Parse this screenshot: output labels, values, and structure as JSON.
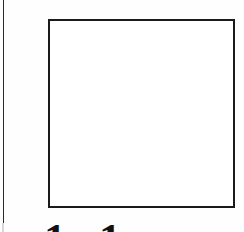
{
  "page": {
    "name": "scanned-page-fragment",
    "width": 244,
    "height": 232,
    "background_color": "#fefefe",
    "ink_color": "#1a1a1a"
  },
  "margin_rule": {
    "name": "left-margin-rule",
    "color": "#2b2b2b",
    "orientation": "vertical"
  },
  "figure_frame": {
    "name": "empty-figure-box",
    "border_color": "#1a1a1a",
    "fill_color": "#ffffff",
    "border_width_px": 2,
    "content": ""
  },
  "clipped_text": {
    "name": "bottom-clipped-caption",
    "note": "only the uppermost few pixels of the glyphs are within frame",
    "glyphs": [
      {
        "char": "1"
      },
      {
        "char": "1"
      }
    ]
  }
}
